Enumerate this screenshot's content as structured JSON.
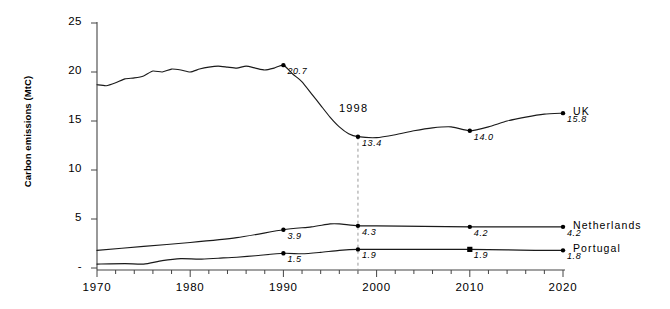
{
  "chart_data": {
    "type": "line",
    "title": "",
    "xlabel": "",
    "ylabel": "Carbon emissions (MtC)",
    "xlim": [
      1970,
      2020
    ],
    "ylim": [
      0,
      25
    ],
    "grid": false,
    "legend": "right-inline",
    "xticks": [
      "1970",
      "1980",
      "1990",
      "2000",
      "2010",
      "2020"
    ],
    "yticks": [
      "-",
      "5",
      "10",
      "15",
      "20",
      "25"
    ],
    "annotations": [
      {
        "text": "1998",
        "x": 1998,
        "y": 16.2
      }
    ],
    "series": [
      {
        "name": "UK",
        "x": [
          1970,
          1971,
          1972,
          1973,
          1974,
          1975,
          1976,
          1977,
          1978,
          1979,
          1980,
          1981,
          1982,
          1983,
          1984,
          1985,
          1986,
          1987,
          1988,
          1989,
          1990,
          1991,
          1992,
          1993,
          1994,
          1995,
          1996,
          1997,
          1998,
          2000,
          2002,
          2004,
          2006,
          2008,
          2010,
          2012,
          2014,
          2016,
          2018,
          2020
        ],
        "values": [
          18.7,
          18.6,
          18.9,
          19.3,
          19.4,
          19.6,
          20.1,
          20.0,
          20.3,
          20.2,
          20.0,
          20.3,
          20.5,
          20.6,
          20.5,
          20.4,
          20.6,
          20.4,
          20.2,
          20.4,
          20.7,
          19.8,
          19.0,
          17.8,
          16.6,
          15.4,
          14.4,
          13.7,
          13.4,
          13.3,
          13.6,
          14.0,
          14.3,
          14.4,
          14.0,
          14.4,
          15.0,
          15.4,
          15.7,
          15.8
        ],
        "labelled_points": [
          {
            "x": 1990,
            "y": 20.7,
            "label": "20.7"
          },
          {
            "x": 1998,
            "y": 13.4,
            "label": "13.4"
          },
          {
            "x": 2010,
            "y": 14.0,
            "label": "14.0"
          },
          {
            "x": 2020,
            "y": 15.8,
            "label": "15.8"
          }
        ]
      },
      {
        "name": "Netherlands",
        "x": [
          1970,
          1975,
          1980,
          1985,
          1990,
          1993,
          1995,
          1996,
          1998,
          2000,
          2005,
          2010,
          2015,
          2020
        ],
        "values": [
          1.8,
          2.2,
          2.6,
          3.1,
          3.9,
          4.2,
          4.5,
          4.5,
          4.3,
          4.3,
          4.25,
          4.2,
          4.2,
          4.2
        ],
        "labelled_points": [
          {
            "x": 1990,
            "y": 3.9,
            "label": "3.9"
          },
          {
            "x": 1998,
            "y": 4.3,
            "label": "4.3"
          },
          {
            "x": 2010,
            "y": 4.2,
            "label": "4.2"
          },
          {
            "x": 2020,
            "y": 4.2,
            "label": "4.2"
          }
        ]
      },
      {
        "name": "Portugal",
        "x": [
          1970,
          1973,
          1975,
          1977,
          1979,
          1981,
          1983,
          1985,
          1987,
          1990,
          1992,
          1994,
          1996,
          1998,
          2002,
          2006,
          2010,
          2014,
          2017,
          2020
        ],
        "values": [
          0.4,
          0.45,
          0.4,
          0.75,
          0.95,
          0.9,
          1.0,
          1.1,
          1.25,
          1.5,
          1.45,
          1.6,
          1.8,
          1.9,
          1.9,
          1.9,
          1.9,
          1.85,
          1.8,
          1.8
        ],
        "labelled_points": [
          {
            "x": 1990,
            "y": 1.5,
            "label": "1.5"
          },
          {
            "x": 1998,
            "y": 1.9,
            "label": "1.9"
          },
          {
            "x": 2010,
            "y": 1.9,
            "label": "1.9"
          },
          {
            "x": 2020,
            "y": 1.8,
            "label": "1.8"
          }
        ]
      }
    ],
    "reference_line": {
      "x": 1998,
      "style": "dashed",
      "color": "#999999"
    },
    "colors": {
      "line": "#1a1a1a",
      "axis": "#333333",
      "marker": "#000000"
    }
  }
}
